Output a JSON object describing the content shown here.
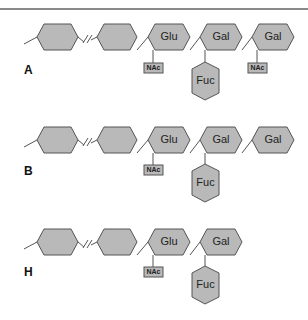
{
  "colors": {
    "hex_fill": "#b9b9b9",
    "stroke": "#555555",
    "text": "#222222",
    "background": "#ffffff"
  },
  "panels": [
    {
      "label": "A",
      "residues": [
        "",
        "",
        "Glu",
        "Gal",
        "Gal"
      ],
      "nac_on": [
        "Glu",
        "Gal(terminal)"
      ],
      "fuc_on": "Gal",
      "nac_label": "NAc",
      "fuc_label": "Fuc"
    },
    {
      "label": "B",
      "residues": [
        "",
        "",
        "Glu",
        "Gal",
        "Gal"
      ],
      "nac_on": [
        "Glu"
      ],
      "fuc_on": "Gal",
      "nac_label": "NAc",
      "fuc_label": "Fuc"
    },
    {
      "label": "H",
      "residues": [
        "",
        "",
        "Glu",
        "Gal"
      ],
      "nac_on": [
        "Glu"
      ],
      "fuc_on": "Gal",
      "nac_label": "NAc",
      "fuc_label": "Fuc"
    }
  ],
  "text": {
    "glu": "Glu",
    "gal": "Gal",
    "fuc": "Fuc",
    "nac": "NAc",
    "a": "A",
    "b": "B",
    "h": "H"
  }
}
